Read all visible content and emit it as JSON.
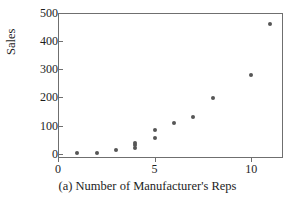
{
  "chart_data": {
    "type": "scatter",
    "title": "",
    "caption": "(a) Number of Manufacturer's Reps",
    "xlabel": "",
    "ylabel": "Sales",
    "xlim": [
      0,
      11.65
    ],
    "ylim": [
      -15,
      500
    ],
    "xticks": [
      0,
      5,
      10
    ],
    "xticklabels": [
      "0",
      "5",
      "10"
    ],
    "yticks": [
      0,
      100,
      200,
      300,
      400,
      500
    ],
    "yticklabels": [
      "0",
      "100",
      "200",
      "300",
      "400",
      "500"
    ],
    "grid": false,
    "legend": false,
    "marker_color": "#565656",
    "axis_color": "#6f6f6f",
    "points": [
      {
        "x": 1,
        "y": 3
      },
      {
        "x": 2,
        "y": 4
      },
      {
        "x": 3,
        "y": 12
      },
      {
        "x": 4,
        "y": 20
      },
      {
        "x": 4,
        "y": 30
      },
      {
        "x": 4,
        "y": 40
      },
      {
        "x": 5,
        "y": 55
      },
      {
        "x": 5,
        "y": 85
      },
      {
        "x": 6,
        "y": 110
      },
      {
        "x": 7,
        "y": 130
      },
      {
        "x": 8,
        "y": 198
      },
      {
        "x": 10,
        "y": 280
      },
      {
        "x": 11,
        "y": 462
      }
    ]
  }
}
